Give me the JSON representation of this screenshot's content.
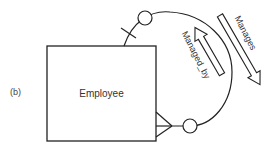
{
  "diagram": {
    "part_label": "(b)",
    "entity": {
      "name": "Employee"
    },
    "relationship": {
      "type": "recursive",
      "direction_labels": {
        "forward": "Manages",
        "reverse": "Managed_by"
      },
      "top_end": {
        "cardinality": "one",
        "optionality": "optional",
        "symbols": [
          "bar",
          "circle"
        ]
      },
      "bottom_end": {
        "cardinality": "many",
        "optionality": "optional",
        "symbols": [
          "crows-foot",
          "circle"
        ]
      }
    },
    "colors": {
      "line": "#222222",
      "background": "#ffffff"
    }
  }
}
